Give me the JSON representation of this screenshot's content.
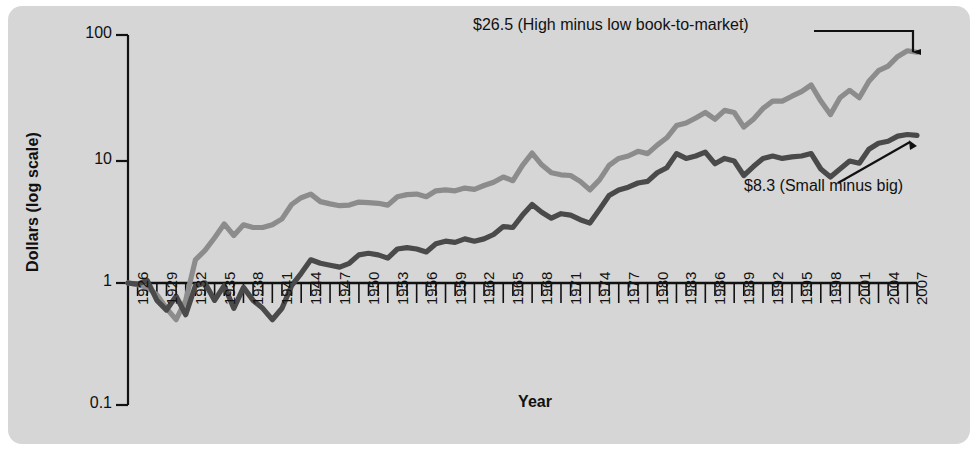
{
  "chart_data": {
    "type": "line",
    "title": "",
    "xlabel": "Year",
    "ylabel": "Dollars (log scale)",
    "yscale": "log",
    "ylim": [
      0.1,
      100
    ],
    "ytick_labels": [
      "100",
      "10",
      "1",
      "0.1"
    ],
    "ytick_values": [
      100,
      10,
      1,
      0.1
    ],
    "xlim": [
      1926,
      2008
    ],
    "xtick_labels": [
      "1926",
      "1929",
      "1932",
      "1935",
      "1938",
      "1941",
      "1944",
      "1947",
      "1950",
      "1953",
      "1956",
      "1959",
      "1962",
      "1965",
      "1968",
      "1971",
      "1974",
      "1977",
      "1980",
      "1983",
      "1986",
      "1989",
      "1992",
      "1995",
      "1998",
      "2001",
      "2004",
      "2007"
    ],
    "xtick_values": [
      1926,
      1929,
      1932,
      1935,
      1938,
      1941,
      1944,
      1947,
      1950,
      1953,
      1956,
      1959,
      1962,
      1965,
      1968,
      1971,
      1974,
      1977,
      1980,
      1983,
      1986,
      1989,
      1992,
      1995,
      1998,
      2001,
      2004,
      2007
    ],
    "minor_ticks_every": 1,
    "grid": false,
    "legend": "annotations",
    "annotations": [
      {
        "name": "high-minus-low",
        "text": "$26.5 (High minus low book-to-market)",
        "value": 26.5,
        "points_to_series": "High minus low book-to-market"
      },
      {
        "name": "small-minus-big",
        "text": "$8.3 (Small minus big)",
        "value": 8.3,
        "points_to_series": "Small minus big"
      }
    ],
    "series": [
      {
        "name": "High minus low book-to-market",
        "color": "#8c8c8c",
        "final_label_value": 26.5,
        "x": [
          1926,
          1927,
          1928,
          1929,
          1930,
          1931,
          1932,
          1933,
          1934,
          1935,
          1936,
          1937,
          1938,
          1939,
          1940,
          1941,
          1942,
          1943,
          1944,
          1945,
          1946,
          1947,
          1948,
          1949,
          1950,
          1951,
          1952,
          1953,
          1954,
          1955,
          1956,
          1957,
          1958,
          1959,
          1960,
          1961,
          1962,
          1963,
          1964,
          1965,
          1966,
          1967,
          1968,
          1969,
          1970,
          1971,
          1972,
          1973,
          1974,
          1975,
          1976,
          1977,
          1978,
          1979,
          1980,
          1981,
          1982,
          1983,
          1984,
          1985,
          1986,
          1987,
          1988,
          1989,
          1990,
          1991,
          1992,
          1993,
          1994,
          1995,
          1996,
          1997,
          1998,
          1999,
          2000,
          2001,
          2002,
          2003,
          2004,
          2005,
          2006,
          2007,
          2008
        ],
        "y": [
          1.0,
          0.97,
          0.92,
          0.8,
          0.62,
          0.5,
          0.72,
          1.55,
          1.85,
          2.35,
          3.05,
          2.45,
          3.0,
          2.85,
          2.85,
          3.0,
          3.35,
          4.4,
          5.0,
          5.35,
          4.65,
          4.45,
          4.3,
          4.35,
          4.6,
          4.55,
          4.5,
          4.35,
          5.1,
          5.3,
          5.35,
          5.1,
          5.7,
          5.8,
          5.7,
          6.0,
          5.85,
          6.3,
          6.7,
          7.4,
          6.9,
          9.2,
          11.6,
          9.3,
          8.0,
          7.7,
          7.6,
          6.8,
          5.8,
          7.0,
          9.2,
          10.5,
          11.0,
          12.0,
          11.5,
          13.5,
          15.5,
          19.5,
          20.5,
          22.5,
          25.0,
          22.0,
          26.0,
          25.0,
          19.0,
          22.0,
          27.0,
          31.0,
          31.0,
          34.0,
          37.0,
          42.0,
          31.0,
          24.0,
          33.0,
          38.0,
          33.0,
          45.0,
          55.0,
          60.0,
          72.0,
          80.0,
          78.0
        ]
      },
      {
        "name": "Small minus big",
        "color": "#4a4a4a",
        "final_label_value": 8.3,
        "x": [
          1926,
          1927,
          1928,
          1929,
          1930,
          1931,
          1932,
          1933,
          1934,
          1935,
          1936,
          1937,
          1938,
          1939,
          1940,
          1941,
          1942,
          1943,
          1944,
          1945,
          1946,
          1947,
          1948,
          1949,
          1950,
          1951,
          1952,
          1953,
          1954,
          1955,
          1956,
          1957,
          1958,
          1959,
          1960,
          1961,
          1962,
          1963,
          1964,
          1965,
          1966,
          1967,
          1968,
          1969,
          1970,
          1971,
          1972,
          1973,
          1974,
          1975,
          1976,
          1977,
          1978,
          1979,
          1980,
          1981,
          1982,
          1983,
          1984,
          1985,
          1986,
          1987,
          1988,
          1989,
          1990,
          1991,
          1992,
          1993,
          1994,
          1995,
          1996,
          1997,
          1998,
          1999,
          2000,
          2001,
          2002,
          2003,
          2004,
          2005,
          2006,
          2007,
          2008
        ],
        "y": [
          1.0,
          0.98,
          1.05,
          0.72,
          0.6,
          0.78,
          0.55,
          0.95,
          1.0,
          0.72,
          0.95,
          0.62,
          0.92,
          0.72,
          0.62,
          0.5,
          0.62,
          0.95,
          1.2,
          1.55,
          1.45,
          1.4,
          1.35,
          1.45,
          1.7,
          1.75,
          1.7,
          1.6,
          1.9,
          1.95,
          1.9,
          1.8,
          2.1,
          2.2,
          2.15,
          2.3,
          2.2,
          2.3,
          2.5,
          2.9,
          2.85,
          3.6,
          4.4,
          3.8,
          3.4,
          3.7,
          3.6,
          3.3,
          3.1,
          4.0,
          5.2,
          5.8,
          6.1,
          6.6,
          6.8,
          8.0,
          8.8,
          11.5,
          10.5,
          11.0,
          11.8,
          9.5,
          10.5,
          10.0,
          7.6,
          9.0,
          10.5,
          11.0,
          10.5,
          10.8,
          11.0,
          11.5,
          8.6,
          7.4,
          8.6,
          10.0,
          9.6,
          12.5,
          14.0,
          14.5,
          16.0,
          16.5,
          16.2
        ]
      }
    ]
  },
  "axes": {
    "y_title": "Dollars (log scale)",
    "x_title": "Year"
  }
}
